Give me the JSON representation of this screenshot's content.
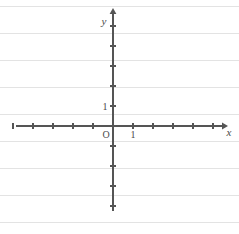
{
  "figure": {
    "kind": "cartesian-coordinate-plane",
    "background_color": "#ffffff",
    "stroke_color": "#555555",
    "rule_color": "#e3e3e3",
    "label_color": "#4a4a4a"
  },
  "labels": {
    "y_axis": "y",
    "x_axis": "x",
    "origin": "O",
    "x_unit": "1",
    "y_unit": "1"
  },
  "chart_data": {
    "type": "scatter",
    "title": "",
    "subtitle": "",
    "xlabel": "x",
    "ylabel": "y",
    "grid": false,
    "legend": "none",
    "origin_label": "O",
    "series": [],
    "x": [],
    "values": [],
    "xlim": [
      -5,
      5
    ],
    "ylim": [
      -4,
      5
    ],
    "x_ticks": [
      -5,
      -4,
      -3,
      -2,
      -1,
      1,
      2,
      3,
      4,
      5
    ],
    "y_ticks": [
      -4,
      -3,
      -2,
      -1,
      1,
      2,
      3,
      4,
      5
    ],
    "x_tick_labels": [
      "",
      "",
      "",
      "",
      "",
      "1",
      "",
      "",
      "",
      ""
    ],
    "y_tick_labels": [
      "",
      "",
      "",
      "",
      "1",
      "",
      "",
      "",
      ""
    ],
    "annotations": [],
    "axis_arrows": {
      "x_positive": true,
      "x_negative": false,
      "y_positive": true,
      "y_negative": false
    },
    "unit_pixels": 20,
    "origin_px": {
      "x": 113,
      "y": 126
    }
  },
  "geometry": {
    "x_axis_start_px": 16,
    "x_axis_end_px": 222,
    "y_axis_top_px": 14,
    "y_axis_bottom_px": 211,
    "tick_half_length_px": 3
  },
  "paper": {
    "rule_spacing_px": 27,
    "rule_offset_px": 6,
    "rule_count": 9
  }
}
